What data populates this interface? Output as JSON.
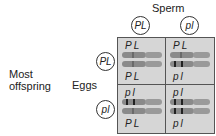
{
  "title": "Sperm",
  "left_label": "Most offspring",
  "row_label": "Eggs",
  "sperm": [
    {
      "label": "PL"
    },
    {
      "label": "pl"
    }
  ],
  "eggs": [
    {
      "label": "PL"
    },
    {
      "label": "pl"
    }
  ],
  "cells": [
    {
      "top": "PL",
      "bottom": "PL",
      "chrom1": "dominant",
      "chrom2": "dominant"
    },
    {
      "top": "PL",
      "bottom": "pl",
      "chrom1": "dominant",
      "chrom2": "recessive"
    },
    {
      "top": "pl",
      "bottom": "PL",
      "chrom1": "recessive",
      "chrom2": "dominant"
    },
    {
      "top": "pl",
      "bottom": "pl",
      "chrom1": "recessive",
      "chrom2": "recessive"
    }
  ],
  "colors": {
    "cell_fill": "#d6d6d6",
    "border": "#555555",
    "chromosome": "#8a8a8a",
    "band": "#222222"
  }
}
